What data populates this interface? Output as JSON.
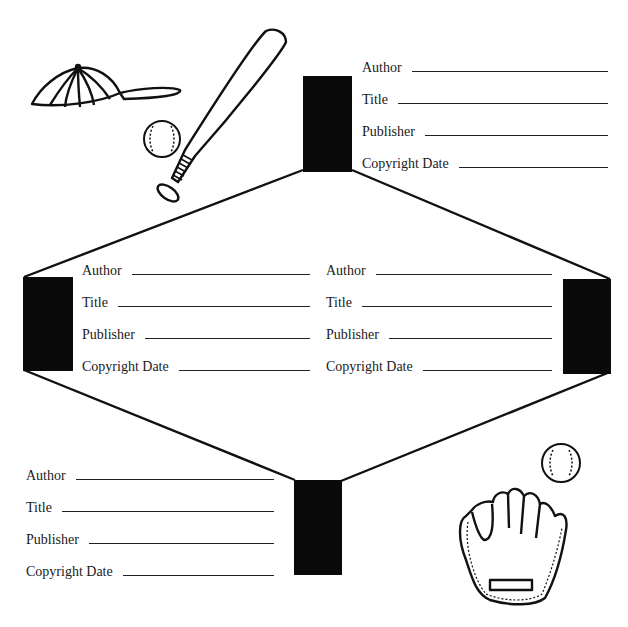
{
  "worksheet": {
    "theme": "baseball",
    "ink_color": "#111111",
    "background_color": "#ffffff",
    "base_groups": [
      {
        "id": "top",
        "fields": [
          {
            "label": "Author",
            "value": ""
          },
          {
            "label": "Title",
            "value": ""
          },
          {
            "label": "Publisher",
            "value": ""
          },
          {
            "label": "Copyright Date",
            "value": ""
          }
        ]
      },
      {
        "id": "left",
        "fields": [
          {
            "label": "Author",
            "value": ""
          },
          {
            "label": "Title",
            "value": ""
          },
          {
            "label": "Publisher",
            "value": ""
          },
          {
            "label": "Copyright Date",
            "value": ""
          }
        ]
      },
      {
        "id": "right",
        "fields": [
          {
            "label": "Author",
            "value": ""
          },
          {
            "label": "Title",
            "value": ""
          },
          {
            "label": "Publisher",
            "value": ""
          },
          {
            "label": "Copyright Date",
            "value": ""
          }
        ]
      },
      {
        "id": "bottom",
        "fields": [
          {
            "label": "Author",
            "value": ""
          },
          {
            "label": "Title",
            "value": ""
          },
          {
            "label": "Publisher",
            "value": ""
          },
          {
            "label": "Copyright Date",
            "value": ""
          }
        ]
      }
    ],
    "illustrations": [
      "baseball-cap-icon",
      "baseball-bat-icon",
      "baseball-icon",
      "baseball-glove-icon"
    ]
  }
}
